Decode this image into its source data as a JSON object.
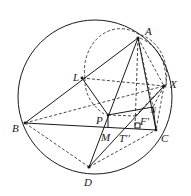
{
  "diagram": {
    "type": "geometry",
    "circumcircle": {
      "cx": 95,
      "cy": 97,
      "r": 77
    },
    "points": {
      "A": {
        "x": 138,
        "y": 38,
        "label": "A",
        "lx": 145,
        "ly": 35
      },
      "X": {
        "x": 164,
        "y": 86,
        "label": "X",
        "lx": 170,
        "ly": 88
      },
      "N": {
        "x": 153,
        "y": 107,
        "label": "N",
        "lx": 149,
        "ly": 113
      },
      "C": {
        "x": 156,
        "y": 130,
        "label": "C",
        "lx": 161,
        "ly": 142
      },
      "B": {
        "x": 25,
        "y": 123,
        "label": "B",
        "lx": 12,
        "ly": 132
      },
      "D": {
        "x": 89,
        "y": 167,
        "label": "D",
        "lx": 84,
        "ly": 185
      },
      "L": {
        "x": 82,
        "y": 78,
        "label": "L",
        "lx": 73,
        "ly": 80
      },
      "P": {
        "x": 108,
        "y": 115,
        "label": "P",
        "lx": 96,
        "ly": 123
      },
      "M": {
        "x": 106,
        "y": 127,
        "label": "M",
        "lx": 101,
        "ly": 141
      },
      "F": {
        "x": 135,
        "y": 116,
        "label": "F'",
        "lx": 140,
        "ly": 125
      },
      "T": {
        "x": 122,
        "y": 130,
        "label": "T''",
        "lx": 119,
        "ly": 142
      }
    },
    "labels": [
      "A",
      "X",
      "N",
      "C",
      "B",
      "D",
      "L",
      "P",
      "M",
      "F'",
      "T''"
    ]
  }
}
